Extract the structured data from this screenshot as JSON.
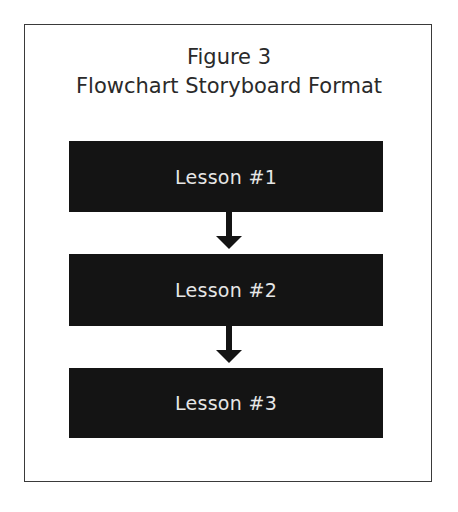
{
  "figure": {
    "label": "Figure 3",
    "title": "Flowchart Storyboard Format"
  },
  "flowchart": {
    "nodes": [
      {
        "label": "Lesson #1"
      },
      {
        "label": "Lesson #2"
      },
      {
        "label": "Lesson #3"
      }
    ],
    "edges": [
      {
        "from": 0,
        "to": 1,
        "icon": "arrow-down-icon"
      },
      {
        "from": 1,
        "to": 2,
        "icon": "arrow-down-icon"
      }
    ],
    "colors": {
      "node_fill": "#141414",
      "node_text": "#e6e6e6",
      "arrow": "#141414",
      "border": "#3a3a3a"
    }
  }
}
